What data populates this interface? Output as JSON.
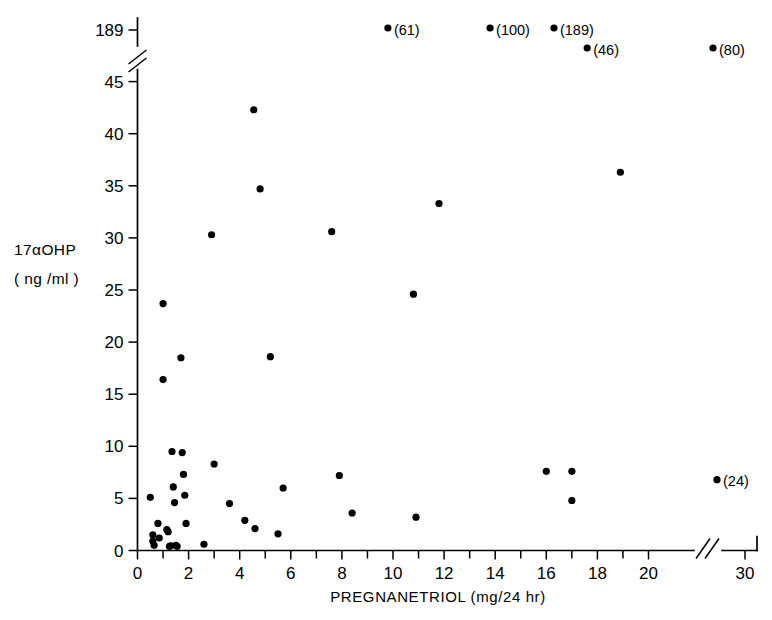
{
  "chart_data": {
    "type": "scatter",
    "title": "",
    "xlabel": "PREGNANETRIOL (mg/24 hr)",
    "ylabel_line1": "17αOHP",
    "ylabel_line2": "( ng /ml )",
    "xlim": [
      0,
      21
    ],
    "ylim": [
      0,
      46
    ],
    "grid": false,
    "legend": "none",
    "x_tick_labels": [
      "0",
      "2",
      "4",
      "6",
      "8",
      "10",
      "12",
      "14",
      "16",
      "18",
      "20",
      "30"
    ],
    "x_tick_values": [
      0,
      2,
      4,
      6,
      8,
      10,
      12,
      14,
      16,
      18,
      20,
      30
    ],
    "x_minor_ticks": [
      1,
      3,
      5,
      7,
      9,
      11,
      13,
      15,
      17,
      19
    ],
    "x_axis_break_between": [
      20,
      30
    ],
    "y_tick_labels": [
      "0",
      "5",
      "10",
      "15",
      "20",
      "25",
      "30",
      "35",
      "40",
      "45",
      "189"
    ],
    "y_tick_values": [
      0,
      5,
      10,
      15,
      20,
      25,
      30,
      35,
      40,
      45,
      189
    ],
    "y_axis_break_between": [
      45,
      189
    ],
    "marker": "filled-circle",
    "marker_color": "#000000",
    "points": [
      {
        "x": 0.5,
        "y": 5.1
      },
      {
        "x": 0.6,
        "y": 1.5
      },
      {
        "x": 0.6,
        "y": 0.9
      },
      {
        "x": 0.65,
        "y": 0.5
      },
      {
        "x": 0.8,
        "y": 2.6
      },
      {
        "x": 0.85,
        "y": 1.2
      },
      {
        "x": 1.0,
        "y": 23.7
      },
      {
        "x": 1.0,
        "y": 16.4
      },
      {
        "x": 1.15,
        "y": 2.0
      },
      {
        "x": 1.2,
        "y": 1.8
      },
      {
        "x": 1.25,
        "y": 0.4
      },
      {
        "x": 1.3,
        "y": 0.45
      },
      {
        "x": 1.35,
        "y": 9.5
      },
      {
        "x": 1.4,
        "y": 6.1
      },
      {
        "x": 1.45,
        "y": 4.6
      },
      {
        "x": 1.5,
        "y": 0.5
      },
      {
        "x": 1.55,
        "y": 0.4
      },
      {
        "x": 1.7,
        "y": 18.5
      },
      {
        "x": 1.75,
        "y": 9.4
      },
      {
        "x": 1.8,
        "y": 7.3
      },
      {
        "x": 1.85,
        "y": 5.3
      },
      {
        "x": 1.9,
        "y": 2.6
      },
      {
        "x": 2.6,
        "y": 0.6
      },
      {
        "x": 2.9,
        "y": 30.3
      },
      {
        "x": 3.0,
        "y": 8.3
      },
      {
        "x": 3.6,
        "y": 4.5
      },
      {
        "x": 4.2,
        "y": 2.9
      },
      {
        "x": 4.55,
        "y": 42.3
      },
      {
        "x": 4.6,
        "y": 2.1
      },
      {
        "x": 4.8,
        "y": 34.7
      },
      {
        "x": 5.2,
        "y": 18.6
      },
      {
        "x": 5.5,
        "y": 1.6
      },
      {
        "x": 5.7,
        "y": 6.0
      },
      {
        "x": 7.6,
        "y": 30.6
      },
      {
        "x": 7.9,
        "y": 7.2
      },
      {
        "x": 8.4,
        "y": 3.6
      },
      {
        "x": 10.8,
        "y": 24.6
      },
      {
        "x": 10.9,
        "y": 3.2
      },
      {
        "x": 11.8,
        "y": 33.3
      },
      {
        "x": 16.0,
        "y": 7.6
      },
      {
        "x": 17.0,
        "y": 7.6
      },
      {
        "x": 17.0,
        "y": 4.8
      },
      {
        "x": 18.9,
        "y": 36.3
      }
    ],
    "offscale_points": [
      {
        "x": 9.8,
        "label": "(61)",
        "value": 61,
        "row": 0
      },
      {
        "x": 13.8,
        "label": "(100)",
        "value": 100,
        "row": 0
      },
      {
        "x": 16.3,
        "label": "(189)",
        "value": 189,
        "row": 0
      },
      {
        "x": 17.6,
        "label": "(46)",
        "value": 46,
        "row": 1
      },
      {
        "x": 30.0,
        "label": "(80)",
        "value": 80,
        "row": 1
      }
    ],
    "offscale_right_point": {
      "x": 30.0,
      "y": 6.8,
      "label": "(24)",
      "value": 24
    }
  }
}
